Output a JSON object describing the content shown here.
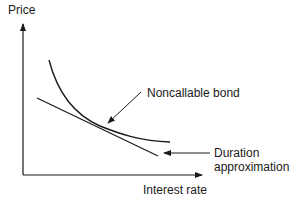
{
  "diagram": {
    "y_axis_label": "Price",
    "x_axis_label": "Interest rate",
    "annotations": {
      "curve": "Noncallable bond",
      "tangent_line1": "Duration",
      "tangent_line2": "approximation"
    },
    "colors": {
      "stroke": "#1a1a1a",
      "background": "#ffffff"
    }
  }
}
